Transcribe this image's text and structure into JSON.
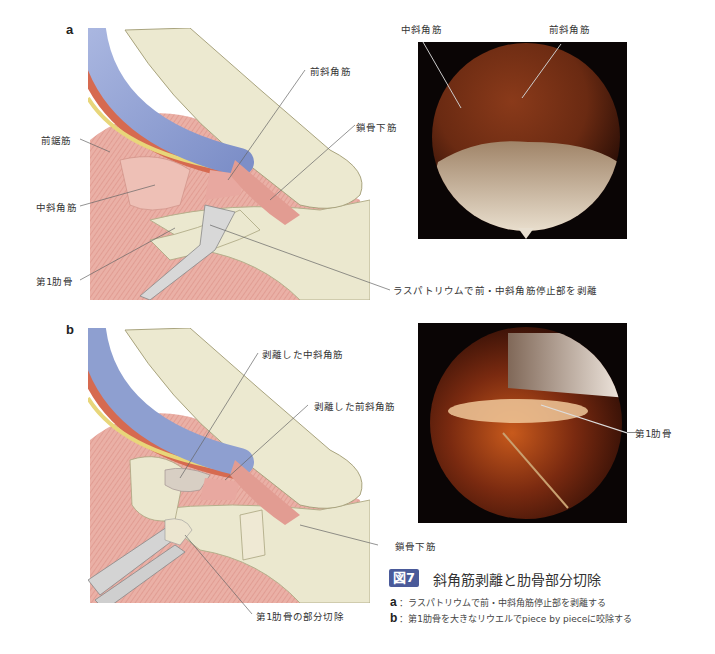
{
  "figure": {
    "number_badge": "図7",
    "title": "斜角筋剥離と肋骨部分切除",
    "captions": [
      {
        "key": "a",
        "text": "：ラスパトリウムで前・中斜角筋停止部を剥離する"
      },
      {
        "key": "b",
        "text": "：第1肋骨を大きなリウエルでpiece by pieceに咬除する"
      }
    ],
    "colors": {
      "badge": "#4a5a9a",
      "vein": "#8e9fd0",
      "artery": "#d66a50",
      "nerve": "#e8d67a",
      "bone": "#ece9d0",
      "muscle": "#e8a8a0",
      "endoscope_bg": "#0a0505"
    }
  },
  "panel_a": {
    "letter": "a",
    "illustration_labels": {
      "serratus_anterior": "前鋸筋",
      "middle_scalene": "中斜角筋",
      "first_rib": "第1肋骨",
      "anterior_scalene": "前斜角筋",
      "subclavius": "鎖骨下筋",
      "raspatory_note": "ラスパトリウムで前・中斜角筋停止部を剥離"
    },
    "endoscope_labels": {
      "middle_scalene": "中斜角筋",
      "anterior_scalene": "前斜角筋"
    }
  },
  "panel_b": {
    "letter": "b",
    "illustration_labels": {
      "detached_middle_scalene": "剥離した中斜角筋",
      "detached_anterior_scalene": "剥離した前斜角筋",
      "subclavius": "鎖骨下筋",
      "partial_rib_resection": "第1肋骨の部分切除"
    },
    "endoscope_labels": {
      "first_rib": "第1肋骨"
    }
  }
}
